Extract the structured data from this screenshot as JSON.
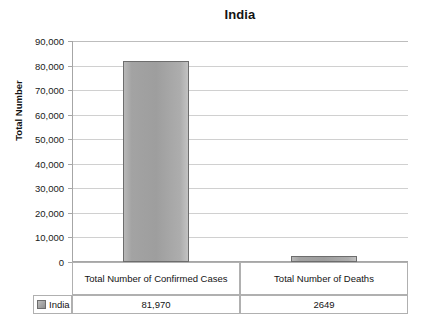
{
  "chart_data": {
    "type": "bar",
    "title": "India",
    "xlabel": "",
    "ylabel": "Total Number",
    "categories": [
      "Total Number of Confirmed Cases",
      "Total Number of Deaths"
    ],
    "series": [
      {
        "name": "India",
        "values": [
          81970,
          2649
        ],
        "value_labels": [
          "81,970",
          "2649"
        ],
        "color": "#9e9e9e"
      }
    ],
    "ylim": [
      0,
      90000
    ],
    "ytick_labels": [
      "90,000",
      "80,000",
      "70,000",
      "60,000",
      "50,000",
      "40,000",
      "30,000",
      "20,000",
      "10,000",
      "0"
    ],
    "ytick_values": [
      90000,
      80000,
      70000,
      60000,
      50000,
      40000,
      30000,
      20000,
      10000,
      0
    ],
    "grid": true,
    "legend_position": "data-table",
    "data_table": {
      "visible": true,
      "legend_label": "India",
      "columns": [
        "Total Number of Confirmed Cases",
        "Total Number of Deaths"
      ],
      "values": [
        "81,970",
        "2649"
      ]
    }
  },
  "colors": {
    "bar_fill": "#9e9e9e",
    "bar_border": "#6d6d6d",
    "gridline": "#d0d0d0",
    "axis": "#a6a6a6",
    "table_border": "#b0b0b0",
    "text": "#131313",
    "background": "#ffffff"
  }
}
